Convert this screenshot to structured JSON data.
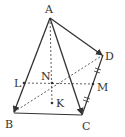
{
  "figure": {
    "type": "tetrahedron with vectors",
    "points": {
      "A": {
        "label": "A",
        "x": 50,
        "y": 18
      },
      "B": {
        "label": "B",
        "x": 14,
        "y": 112
      },
      "C": {
        "label": "C",
        "x": 82,
        "y": 115
      },
      "D": {
        "label": "D",
        "x": 103,
        "y": 55
      },
      "L": {
        "label": "L",
        "x": 24,
        "y": 83
      },
      "M": {
        "label": "M",
        "x": 93,
        "y": 84
      },
      "N": {
        "label": "N",
        "x": 52,
        "y": 83
      },
      "K": {
        "label": "K",
        "x": 52,
        "y": 103
      }
    },
    "vectors": [
      "AB",
      "AC",
      "AD"
    ],
    "solid_edges": [
      "BC",
      "CD"
    ],
    "dashed_segments": [
      "AK",
      "LM",
      "BD"
    ],
    "equal_marks": [
      "DM",
      "MC"
    ],
    "colors": {
      "line": "#333333",
      "background": "#ffffff"
    }
  }
}
